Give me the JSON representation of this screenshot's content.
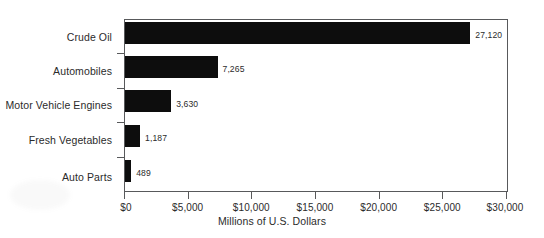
{
  "chart_data": {
    "type": "bar",
    "orientation": "horizontal",
    "title": "",
    "xlabel": "Millions of U.S. Dollars",
    "ylabel": "",
    "categories": [
      "Crude Oil",
      "Automobiles",
      "Motor Vehicle Engines",
      "Fresh Vegetables",
      "Auto Parts"
    ],
    "values": [
      27120,
      7265,
      3630,
      1187,
      489
    ],
    "value_labels": [
      "27,120",
      "7,265",
      "3,630",
      "1,187",
      "489"
    ],
    "xlim": [
      0,
      30000
    ],
    "xticks": [
      0,
      5000,
      10000,
      15000,
      20000,
      25000,
      30000
    ],
    "xtick_labels": [
      "$0",
      "$5,000",
      "$10,000",
      "$15,000",
      "$20,000",
      "$25,000",
      "$30,000"
    ],
    "grid": false,
    "legend": null,
    "bar_color": "#0d0d0d",
    "axis_color": "#58595b",
    "background_color": "#ffffff"
  }
}
